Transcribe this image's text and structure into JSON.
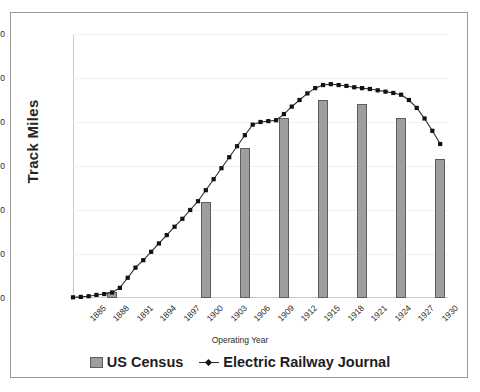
{
  "chart_data": {
    "type": "bar",
    "title": "",
    "xlabel": "Operating Year",
    "ylabel": "Track Miles",
    "ylim": [
      0,
      60000
    ],
    "xlim": [
      1885,
      1933
    ],
    "grid": true,
    "legend_position": "bottom",
    "ytick_labels": [
      "60,000",
      "50,000",
      "40,000",
      "30,000",
      "20,000",
      "10,000",
      "0"
    ],
    "ytick_values": [
      60000,
      50000,
      40000,
      30000,
      20000,
      10000,
      0
    ],
    "xtick_labels": [
      "1885",
      "1888",
      "1891",
      "1894",
      "1897",
      "1900",
      "1903",
      "1906",
      "1909",
      "1912",
      "1915",
      "1918",
      "1921",
      "1924",
      "1927",
      "1930"
    ],
    "xtick_values": [
      1885,
      1888,
      1891,
      1894,
      1897,
      1900,
      1903,
      1906,
      1909,
      1912,
      1915,
      1918,
      1921,
      1924,
      1927,
      1930
    ],
    "series": [
      {
        "name": "US Census",
        "type": "bar",
        "color": "#9d9d9d",
        "x": [
          1890,
          1902,
          1907,
          1912,
          1917,
          1922,
          1927,
          1932
        ],
        "values": [
          1260,
          21900,
          34000,
          40900,
          44900,
          44000,
          40800,
          31500
        ]
      },
      {
        "name": "Electric Railway Journal",
        "type": "line",
        "color": "#2b2b2b",
        "marker": "square",
        "x": [
          1885,
          1886,
          1887,
          1888,
          1889,
          1890,
          1891,
          1892,
          1893,
          1894,
          1895,
          1896,
          1897,
          1898,
          1899,
          1900,
          1901,
          1902,
          1903,
          1904,
          1905,
          1906,
          1907,
          1908,
          1909,
          1910,
          1911,
          1912,
          1913,
          1914,
          1915,
          1916,
          1917,
          1918,
          1919,
          1920,
          1921,
          1922,
          1923,
          1924,
          1925,
          1926,
          1927,
          1928,
          1929,
          1930,
          1931,
          1932
        ],
        "values": [
          150,
          250,
          400,
          700,
          900,
          1260,
          2300,
          4600,
          6900,
          8600,
          10500,
          12400,
          14300,
          16200,
          18000,
          20000,
          22000,
          24500,
          27000,
          29500,
          32000,
          34500,
          37000,
          39400,
          40000,
          40200,
          40400,
          41800,
          43500,
          45000,
          46500,
          47700,
          48400,
          48600,
          48400,
          48200,
          47900,
          47700,
          47500,
          47200,
          46900,
          46600,
          46200,
          45000,
          43200,
          40800,
          38000,
          35000
        ]
      }
    ]
  },
  "legend": {
    "items": [
      {
        "label": "US Census",
        "marker": "bar-swatch"
      },
      {
        "label": "Electric Railway Journal",
        "marker": "line-square"
      }
    ]
  },
  "axis": {
    "y_title": "Track Miles",
    "x_title": "Operating Year"
  }
}
